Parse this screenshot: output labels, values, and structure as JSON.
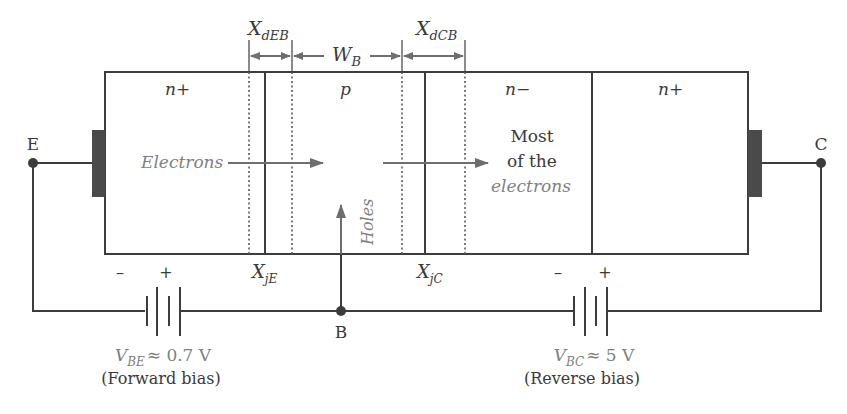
{
  "diagram": {
    "type": "NPN bipolar junction transistor biasing diagram",
    "colors": {
      "line": "#3c3c3c",
      "contact": "#4a4a4a",
      "dimension": "#6e6e6e",
      "carrier_text": "#808080",
      "text": "#3a3a3a"
    },
    "dimensions": {
      "xdeb": {
        "main": "X",
        "sub": "dEB"
      },
      "wb": {
        "main": "W",
        "sub": "B"
      },
      "xdcb": {
        "main": "X",
        "sub": "dCB"
      }
    },
    "regions": [
      {
        "id": "emitter",
        "label": "n+"
      },
      {
        "id": "base",
        "label": "p"
      },
      {
        "id": "collector-drift",
        "label": "n−"
      },
      {
        "id": "collector-contact",
        "label": "n+"
      }
    ],
    "terminals": {
      "emitter": "E",
      "base": "B",
      "collector": "C"
    },
    "junctions": {
      "xje": {
        "main": "X",
        "sub": "jE"
      },
      "xjc": {
        "main": "X",
        "sub": "jC"
      }
    },
    "carriers": {
      "electrons": "Electrons",
      "holes": "Holes",
      "collected_line1": "Most",
      "collected_line2": "of the",
      "collected_line3": "electrons"
    },
    "batteries": [
      {
        "id": "vbe",
        "minus": "–",
        "plus": "+",
        "voltage_main": "V",
        "voltage_sub": "BE",
        "voltage_value": "≈ 0.7 V",
        "bias": "(Forward bias)"
      },
      {
        "id": "vbc",
        "minus": "–",
        "plus": "+",
        "voltage_main": "V",
        "voltage_sub": "BC",
        "voltage_value": "≈ 5 V",
        "bias": "(Reverse bias)"
      }
    ]
  }
}
